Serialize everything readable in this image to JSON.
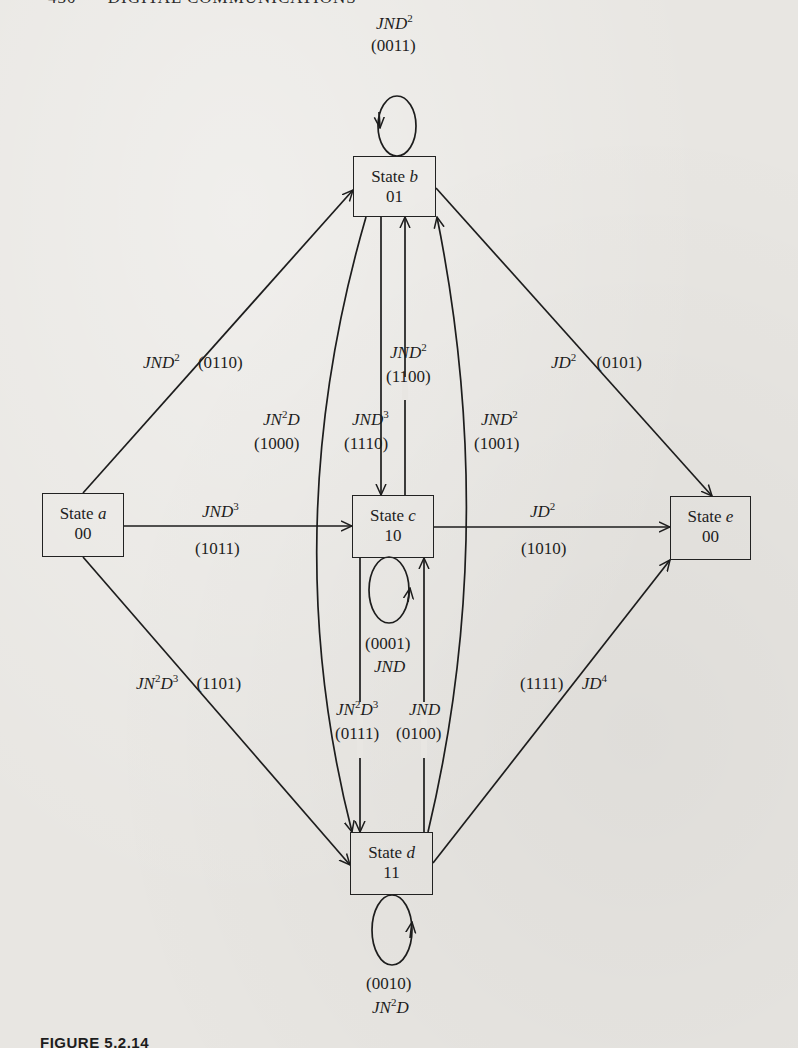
{
  "header": {
    "page_number": "430",
    "running_title": "DIGITAL COMMUNICATIONS"
  },
  "states": [
    {
      "id": "a",
      "label": "State",
      "letter": "a",
      "code": "00",
      "box": [
        42,
        493,
        82,
        64
      ]
    },
    {
      "id": "b",
      "label": "State",
      "letter": "b",
      "code": "01",
      "box": [
        353,
        156,
        83,
        61
      ]
    },
    {
      "id": "c",
      "label": "State",
      "letter": "c",
      "code": "10",
      "box": [
        352,
        495,
        82,
        63
      ]
    },
    {
      "id": "d",
      "label": "State",
      "letter": "d",
      "code": "11",
      "box": [
        350,
        832,
        83,
        63
      ]
    },
    {
      "id": "e",
      "label": "State",
      "letter": "e",
      "code": "00",
      "box": [
        670,
        496,
        81,
        64
      ]
    }
  ],
  "transitions": [
    {
      "from": "b",
      "to": "b",
      "expr_base": "JND",
      "expr_sup": "2",
      "code": "(0011)",
      "pos": [
        397,
        14
      ],
      "pos2": [
        377,
        36
      ],
      "stacked": true
    },
    {
      "from": "a",
      "to": "b",
      "expr_base": "JND",
      "expr_sup": "2",
      "code": "(0110)",
      "pos": [
        143,
        358
      ]
    },
    {
      "from": "b",
      "to": "e",
      "expr_base": "JD",
      "expr_sup": "2",
      "code": "(0101)",
      "pos": [
        551,
        358
      ]
    },
    {
      "from": "a",
      "to": "d",
      "expr_pre": "JN",
      "expr_pre_sup": "2",
      "expr_base": "D",
      "expr_sup": "",
      "expr_mid": "D",
      "code": "(1000)",
      "pos": [
        262,
        413
      ],
      "pos2": [
        254,
        437
      ],
      "stacked": true,
      "note": "b to d curve"
    },
    {
      "from": "b",
      "to": "c",
      "expr_base": "JND",
      "expr_sup": "3",
      "code": "(1110)",
      "pos": [
        352,
        413
      ],
      "pos2": [
        344,
        437
      ],
      "stacked": true
    },
    {
      "from": "c",
      "to": "b",
      "expr_base": "JND",
      "expr_sup": "2",
      "code": "(1100)",
      "pos": [
        389,
        347
      ],
      "pos2": [
        385,
        371
      ],
      "stacked": true
    },
    {
      "from": "d",
      "to": "b",
      "expr_base": "JND",
      "expr_sup": "2",
      "code": "(1001)",
      "pos": [
        481,
        413
      ],
      "pos2": [
        475,
        437
      ],
      "stacked": true
    },
    {
      "from": "a",
      "to": "c",
      "expr_base": "JND",
      "expr_sup": "3",
      "code": "(1011)",
      "pos": [
        203,
        502
      ],
      "pos2": [
        195,
        543
      ],
      "stacked": false
    },
    {
      "from": "c",
      "to": "e",
      "expr_base": "JD",
      "expr_sup": "2",
      "code": "(1010)",
      "pos": [
        530,
        502
      ],
      "pos2": [
        520,
        543
      ],
      "stacked": false
    },
    {
      "from": "c",
      "to": "c",
      "expr_base": "JND",
      "expr_sup": "",
      "code": "(0001)",
      "pos": [
        373,
        636
      ],
      "pos2": [
        366,
        612
      ],
      "stacked": true,
      "code_first": true
    },
    {
      "from": "a",
      "to": "d",
      "expr_pre": "JN",
      "expr_pre_sup": "2",
      "expr_base": "D",
      "expr_sup": "3",
      "code": "(1101)",
      "pos": [
        136,
        678
      ]
    },
    {
      "from": "d",
      "to": "e",
      "expr_base": "JD",
      "expr_sup": "4",
      "code": "(1111)",
      "pos": [
        520,
        678
      ]
    },
    {
      "from": "c",
      "to": "d",
      "expr_pre": "JN",
      "expr_pre_sup": "2",
      "expr_base": "D",
      "expr_sup": "3",
      "code": "(0111)",
      "pos": [
        335,
        703
      ],
      "pos2": [
        335,
        727
      ],
      "stacked": true
    },
    {
      "from": "d",
      "to": "c",
      "expr_base": "JND",
      "expr_sup": "",
      "code": "(0100)",
      "pos": [
        408,
        703
      ],
      "pos2": [
        397,
        727
      ],
      "stacked": true
    },
    {
      "from": "d",
      "to": "d",
      "expr_pre": "JN",
      "expr_pre_sup": "2",
      "expr_base": "D",
      "expr_sup": "",
      "code": "(0010)",
      "pos": [
        372,
        1000
      ],
      "pos2": [
        365,
        976
      ],
      "stacked": true,
      "code_first": true
    }
  ],
  "labels": {
    "b_self": {
      "code": "(0011)"
    },
    "a_b": {
      "code": "(0110)"
    },
    "b_e": {
      "code": "(0101)"
    },
    "b_d_curve": {
      "code": "(1000)"
    },
    "b_c": {
      "code": "(1110)"
    },
    "c_b": {
      "code": "(1100)"
    },
    "d_b_curve": {
      "code": "(1001)"
    },
    "a_c": {
      "code": "(1011)"
    },
    "c_e": {
      "code": "(1010)"
    },
    "c_self": {
      "code": "(0001)"
    },
    "a_d": {
      "code": "(1101)"
    },
    "d_e": {
      "code": "(1111)"
    },
    "c_d": {
      "code": "(0111)"
    },
    "d_c": {
      "code": "(0100)"
    },
    "d_self": {
      "code": "(0010)"
    }
  },
  "caption": "FIGURE 5.2.14"
}
